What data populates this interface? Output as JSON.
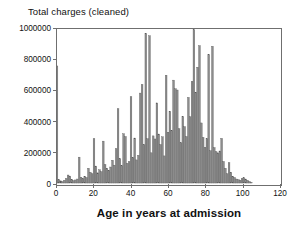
{
  "chart_data": {
    "type": "bar",
    "title": "",
    "xlabel": "Age in years at admission",
    "ylabel": "Total charges (cleaned)",
    "grid": false,
    "legend": false,
    "xlim": [
      0,
      120
    ],
    "ylim": [
      0,
      1000000
    ],
    "xticks": [
      0,
      20,
      40,
      60,
      80,
      100,
      120
    ],
    "yticks": [
      0,
      200000,
      400000,
      600000,
      800000,
      1000000
    ],
    "xtick_labels": [
      "0",
      "20",
      "40",
      "60",
      "80",
      "100",
      "120"
    ],
    "ytick_labels": [
      "0",
      "200000",
      "400000",
      "600000",
      "800000",
      "1000000"
    ],
    "bar_color": "#8c8c8c",
    "bar_edge_color": "#555555",
    "frame_color": "#6f6f6f",
    "x": [
      0,
      1,
      2,
      3,
      4,
      5,
      6,
      7,
      8,
      9,
      10,
      11,
      12,
      13,
      14,
      15,
      16,
      17,
      18,
      19,
      20,
      21,
      22,
      23,
      24,
      25,
      26,
      27,
      28,
      29,
      30,
      31,
      32,
      33,
      34,
      35,
      36,
      37,
      38,
      39,
      40,
      41,
      42,
      43,
      44,
      45,
      46,
      47,
      48,
      49,
      50,
      51,
      52,
      53,
      54,
      55,
      56,
      57,
      58,
      59,
      60,
      61,
      62,
      63,
      64,
      65,
      66,
      67,
      68,
      69,
      70,
      71,
      72,
      73,
      74,
      75,
      76,
      77,
      78,
      79,
      80,
      81,
      82,
      83,
      84,
      85,
      86,
      87,
      88,
      89,
      90,
      91,
      92,
      93,
      94,
      95,
      96,
      97,
      98,
      99,
      100,
      101,
      102,
      103,
      104,
      105
    ],
    "values": [
      760000,
      22000,
      14000,
      10000,
      18000,
      30000,
      52000,
      45000,
      24000,
      16000,
      20000,
      26000,
      168000,
      38000,
      30000,
      44000,
      36000,
      96000,
      70000,
      60000,
      288000,
      110000,
      66000,
      86000,
      74000,
      272000,
      120000,
      96000,
      82000,
      104000,
      148000,
      116000,
      224000,
      482000,
      158000,
      112000,
      320000,
      302000,
      128000,
      140000,
      560000,
      166000,
      292000,
      150000,
      180000,
      584000,
      640000,
      250000,
      972000,
      288000,
      956000,
      196000,
      306000,
      286000,
      520000,
      318000,
      250000,
      300000,
      176000,
      700000,
      330000,
      466000,
      340000,
      668000,
      612000,
      604000,
      352000,
      262000,
      432000,
      366000,
      302000,
      556000,
      430000,
      660000,
      996000,
      590000,
      752000,
      892000,
      390000,
      296000,
      232000,
      288000,
      834000,
      210000,
      888000,
      230000,
      204000,
      196000,
      208000,
      290000,
      140000,
      96000,
      60000,
      132000,
      70000,
      44000,
      36000,
      26000,
      22000,
      18000,
      30000,
      34000,
      26000,
      18000,
      10000,
      4000
    ]
  },
  "axis": {
    "y_title": "Total charges (cleaned)",
    "x_title": "Age in years at admission"
  }
}
